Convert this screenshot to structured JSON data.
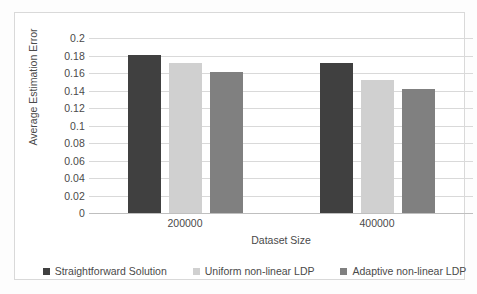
{
  "chart_data": {
    "type": "bar",
    "title": "",
    "xlabel": "Dataset Size",
    "ylabel": "Average Estimation Error",
    "categories": [
      "200000",
      "400000"
    ],
    "series": [
      {
        "name": "Straightforward Solution",
        "color": "#404040",
        "values": [
          0.181,
          0.172
        ]
      },
      {
        "name": "Uniform non-linear LDP",
        "color": "#d0d0d0",
        "values": [
          0.171,
          0.152
        ]
      },
      {
        "name": "Adaptive non-linear LDP",
        "color": "#808080",
        "values": [
          0.161,
          0.142
        ]
      }
    ],
    "ylim": [
      0,
      0.2
    ],
    "ytick_values": [
      0,
      0.02,
      0.04,
      0.06,
      0.08,
      0.1,
      0.12,
      0.14,
      0.16,
      0.18,
      0.2
    ],
    "ytick_labels": [
      "0",
      "0.02",
      "0.04",
      "0.06",
      "0.08",
      "0.1",
      "0.12",
      "0.14",
      "0.16",
      "0.18",
      "0.2"
    ],
    "grid": true,
    "legend_position": "bottom"
  },
  "colors": {
    "series_1": "#404040",
    "series_2": "#d0d0d0",
    "series_3": "#808080",
    "gridline": "#d9d9d9",
    "frame": "#d9d9d9",
    "text": "#4a4a4a"
  }
}
